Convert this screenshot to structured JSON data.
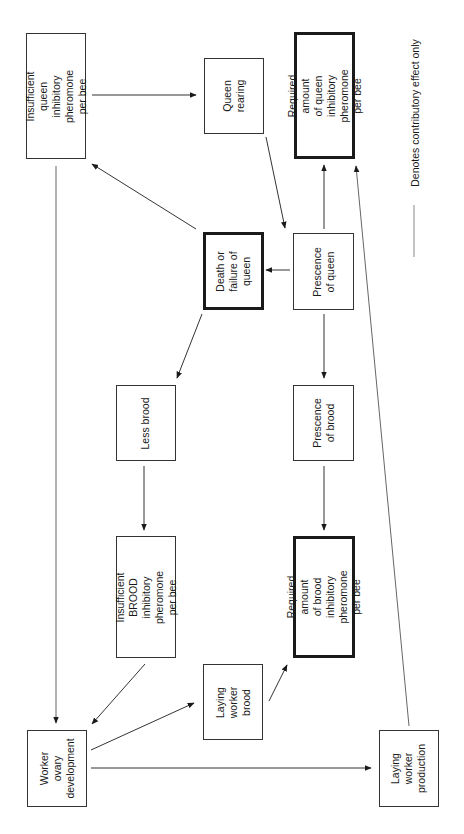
{
  "diagram": {
    "orientation": "rotated -90deg (text reads bottom-to-top)",
    "nodes": {
      "insufficient_queen": "Insufficient queen\ninhibitory pheromone\nper bee",
      "queen_rearing": "Queen\nrearing",
      "required_queen": "Required amount\nof queen inhibitory\npheromone per bee",
      "death_failure": "Death or\nfailure of\nqueen",
      "presence_queen": "Prescence\nof queen",
      "less_brood": "Less brood",
      "presence_brood": "Prescence\nof brood",
      "insufficient_brood": "Insufficient\nBROOD inhibitory\npheromone per bee",
      "required_brood": "Required amount\nof brood inhibitory\npheromone per bee",
      "laying_worker_brood": "Laying\nworker brood",
      "worker_ovary": "Worker ovary\ndevelopment",
      "laying_worker_production": "Laying\nworker\nproduction"
    },
    "legend": {
      "text": "Denotes contributory effect only",
      "line_color": "#888888"
    },
    "edges": [
      {
        "from": "insufficient_queen",
        "to": "queen_rearing",
        "type": "arrow"
      },
      {
        "from": "queen_rearing",
        "to": "presence_queen",
        "type": "arrow"
      },
      {
        "from": "presence_queen",
        "to": "required_queen",
        "type": "arrow"
      },
      {
        "from": "laying_worker_production",
        "to": "required_queen",
        "type": "arrow"
      },
      {
        "from": "presence_queen",
        "to": "death_failure",
        "type": "arrow"
      },
      {
        "from": "death_failure",
        "to": "insufficient_queen",
        "type": "arrow"
      },
      {
        "from": "death_failure",
        "to": "less_brood",
        "type": "arrow"
      },
      {
        "from": "presence_queen",
        "to": "presence_brood",
        "type": "arrow"
      },
      {
        "from": "less_brood",
        "to": "insufficient_brood",
        "type": "arrow"
      },
      {
        "from": "presence_brood",
        "to": "required_brood",
        "type": "arrow"
      },
      {
        "from": "insufficient_queen",
        "to": "worker_ovary",
        "type": "arrow"
      },
      {
        "from": "insufficient_brood",
        "to": "worker_ovary",
        "type": "arrow"
      },
      {
        "from": "worker_ovary",
        "to": "laying_worker_brood",
        "type": "arrow"
      },
      {
        "from": "laying_worker_brood",
        "to": "required_brood",
        "type": "arrow"
      },
      {
        "from": "worker_ovary",
        "to": "laying_worker_production",
        "type": "arrow"
      }
    ],
    "colors": {
      "line": "#333333",
      "box_border": "#333333",
      "thick_border": "#1a1a1a",
      "background": "#ffffff"
    }
  }
}
